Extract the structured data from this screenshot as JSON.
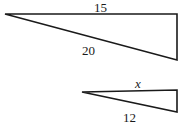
{
  "figure": {
    "type": "geometry-diagram",
    "background_color": "#ffffff",
    "stroke_color": "#1a1a1a",
    "shapes": [
      {
        "name": "large-triangle",
        "vertices": [
          [
            5,
            14
          ],
          [
            177,
            14
          ],
          [
            177,
            60
          ]
        ],
        "labels": [
          {
            "name": "top-side",
            "text": "15"
          },
          {
            "name": "hypotenuse",
            "text": "20"
          }
        ]
      },
      {
        "name": "small-triangle",
        "vertices": [
          [
            82,
            92
          ],
          [
            177,
            90
          ],
          [
            177,
            112
          ]
        ],
        "labels": [
          {
            "name": "top-side",
            "text": "x"
          },
          {
            "name": "hypotenuse",
            "text": "12"
          }
        ]
      }
    ],
    "labels": {
      "large_top": "15",
      "large_hyp": "20",
      "small_top": "x",
      "small_hyp": "12"
    }
  }
}
